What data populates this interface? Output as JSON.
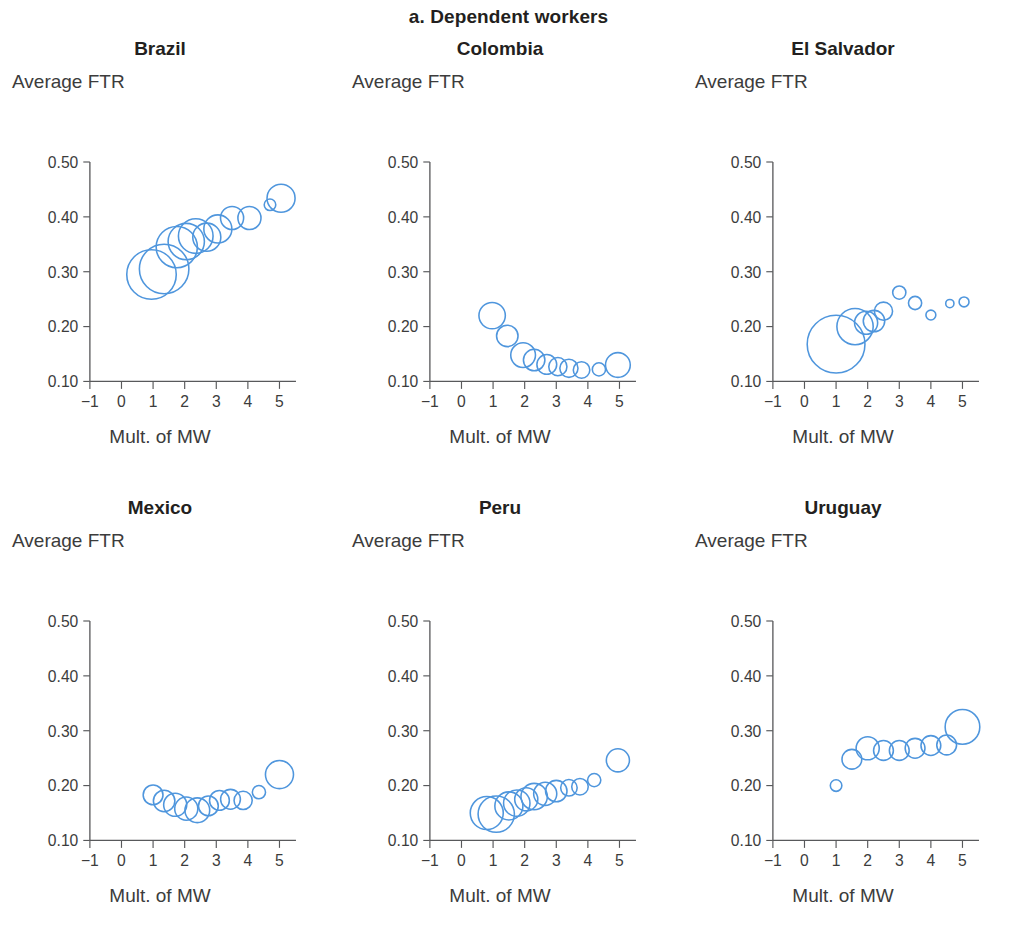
{
  "figure": {
    "title": "a. Dependent workers",
    "accent_color": "#4f96dd",
    "axis_color": "#58595b",
    "text_color": "#231f20"
  },
  "axes": {
    "ylabel": "Average FTR",
    "xlabel": "Mult. of MW",
    "yticks": [
      "0.50",
      "0.40",
      "0.30",
      "0.20",
      "0.10"
    ],
    "ytick_values": [
      0.5,
      0.4,
      0.3,
      0.2,
      0.1
    ],
    "xticks": [
      "−1",
      "0",
      "1",
      "2",
      "3",
      "4",
      "5"
    ],
    "xtick_values": [
      -1,
      0,
      1,
      2,
      3,
      4,
      5
    ],
    "xlim": [
      -1.4,
      5.5
    ],
    "ylim": [
      0.1,
      0.5
    ]
  },
  "chart_data": {
    "type": "scatter",
    "title": "a. Dependent workers",
    "xlabel": "Mult. of MW",
    "ylabel": "Average FTR",
    "xlim": [
      -1.4,
      5.5
    ],
    "ylim": [
      0.1,
      0.5
    ],
    "grid": false,
    "legend": "none",
    "marker": "open-circle-bubble",
    "size_encoding": "bubble area proportional to number of workers",
    "panels": [
      {
        "name": "Brazil",
        "x": [
          0.95,
          1.35,
          1.75,
          2.05,
          2.35,
          2.7,
          3.05,
          3.5,
          4.05,
          4.7,
          5.05
        ],
        "y": [
          0.295,
          0.305,
          0.345,
          0.355,
          0.365,
          0.363,
          0.378,
          0.398,
          0.398,
          0.422,
          0.434
        ],
        "r": [
          30,
          30,
          25,
          22,
          21,
          17,
          17,
          14,
          14,
          7,
          17
        ]
      },
      {
        "name": "Colombia",
        "x": [
          0.97,
          1.45,
          1.95,
          2.3,
          2.7,
          3.05,
          3.4,
          3.8,
          4.35,
          4.95
        ],
        "y": [
          0.22,
          0.183,
          0.148,
          0.139,
          0.131,
          0.127,
          0.124,
          0.121,
          0.122,
          0.13
        ],
        "r": [
          16,
          13,
          15,
          13,
          12,
          11,
          11,
          10,
          8,
          15
        ]
      },
      {
        "name": "El Salvador",
        "x": [
          1.0,
          1.6,
          1.95,
          2.2,
          2.5,
          3.0,
          3.5,
          4.0,
          4.6,
          5.05
        ],
        "y": [
          0.168,
          0.2,
          0.207,
          0.21,
          0.228,
          0.262,
          0.243,
          0.221,
          0.242,
          0.245
        ],
        "r": [
          35,
          22,
          14,
          13,
          11,
          8,
          8,
          6,
          5,
          6
        ]
      },
      {
        "name": "Mexico",
        "x": [
          1.0,
          1.35,
          1.7,
          2.05,
          2.4,
          2.75,
          3.1,
          3.45,
          3.85,
          4.35,
          5.0
        ],
        "y": [
          0.183,
          0.172,
          0.165,
          0.158,
          0.155,
          0.163,
          0.173,
          0.175,
          0.173,
          0.188,
          0.22
        ],
        "r": [
          12,
          13,
          14,
          14,
          15,
          12,
          12,
          12,
          11,
          8,
          17
        ]
      },
      {
        "name": "Peru",
        "x": [
          0.8,
          1.1,
          1.5,
          1.75,
          2.05,
          2.3,
          2.65,
          3.0,
          3.4,
          3.75,
          4.2,
          4.95
        ],
        "y": [
          0.15,
          0.148,
          0.163,
          0.168,
          0.175,
          0.18,
          0.185,
          0.19,
          0.196,
          0.198,
          0.21,
          0.246
        ],
        "r": [
          20,
          22,
          17,
          16,
          14,
          16,
          14,
          13,
          10,
          10,
          8,
          14
        ]
      },
      {
        "name": "Uruguay",
        "x": [
          1.0,
          1.5,
          2.0,
          2.5,
          3.0,
          3.5,
          4.0,
          4.5,
          5.0
        ],
        "y": [
          0.2,
          0.248,
          0.268,
          0.264,
          0.264,
          0.268,
          0.273,
          0.274,
          0.307
        ],
        "r": [
          7,
          12,
          14,
          12,
          12,
          12,
          12,
          12,
          21
        ]
      }
    ]
  }
}
